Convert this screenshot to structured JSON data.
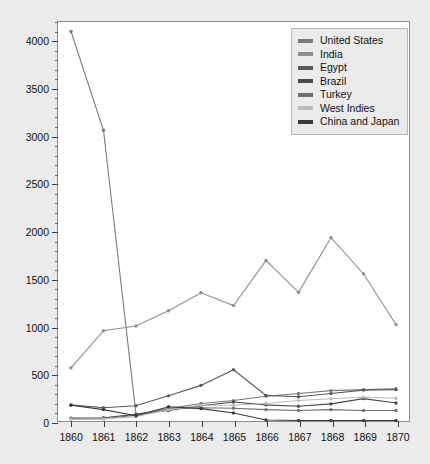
{
  "chart_data": {
    "type": "line",
    "title": "",
    "xlabel": "",
    "ylabel": "Cotton imports per thousand 400-pound bales",
    "x": [
      1860,
      1861,
      1862,
      1863,
      1864,
      1865,
      1866,
      1867,
      1868,
      1869,
      1870
    ],
    "xtick_labels": [
      "1860",
      "1861",
      "1862",
      "1863",
      "1864",
      "1865",
      "1866",
      "1867",
      "1868",
      "1869",
      "1870"
    ],
    "ytick_labels": [
      "0",
      "500",
      "1000",
      "1500",
      "2000",
      "2500",
      "3000",
      "3500",
      "4000"
    ],
    "ytick_values": [
      0,
      500,
      1000,
      1500,
      2000,
      2500,
      3000,
      3500,
      4000
    ],
    "ylim": [
      0,
      4200
    ],
    "xlim": [
      1859.6,
      1870.4
    ],
    "grid": false,
    "minor_ticks": true,
    "legend_position": "top-right",
    "series": [
      {
        "name": "United States",
        "color": "#7a7a7a",
        "values": [
          4100,
          3060,
          70,
          130,
          185,
          215,
          260,
          290,
          320,
          330,
          340
        ]
      },
      {
        "name": "India",
        "color": "#8f8f8f",
        "values": [
          560,
          950,
          1000,
          1160,
          1350,
          1215,
          1690,
          1355,
          1930,
          1550,
          1015
        ]
      },
      {
        "name": "Egypt",
        "color": "#5a5a5a",
        "values": [
          170,
          140,
          160,
          265,
          375,
          540,
          270,
          255,
          290,
          325,
          330
        ]
      },
      {
        "name": "Brazil",
        "color": "#4a4a4a",
        "values": [
          30,
          35,
          70,
          110,
          160,
          200,
          170,
          155,
          180,
          235,
          190
        ]
      },
      {
        "name": "Turkey",
        "color": "#6f6f6f",
        "values": [
          20,
          25,
          60,
          130,
          140,
          135,
          120,
          110,
          120,
          110,
          110
        ]
      },
      {
        "name": "West Indies",
        "color": "#bcbcbc",
        "values": [
          18,
          22,
          45,
          120,
          165,
          165,
          185,
          215,
          235,
          250,
          240
        ]
      },
      {
        "name": "China and Japan",
        "color": "#3a3a3a",
        "values": [
          165,
          120,
          55,
          150,
          130,
          85,
          10,
          5,
          5,
          5,
          5
        ]
      }
    ]
  },
  "legend": {
    "items": [
      {
        "label": "United States"
      },
      {
        "label": "India"
      },
      {
        "label": "Egypt"
      },
      {
        "label": "Brazil"
      },
      {
        "label": "Turkey"
      },
      {
        "label": "West Indies"
      },
      {
        "label": "China and Japan"
      }
    ]
  }
}
